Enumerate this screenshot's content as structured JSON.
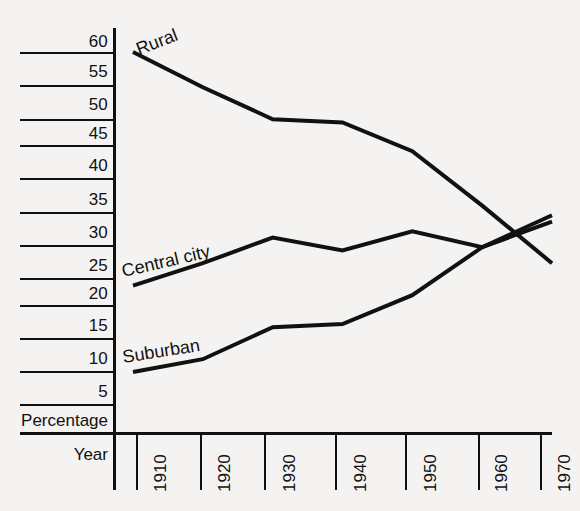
{
  "chart_data": {
    "type": "line",
    "title": "",
    "xlabel": "Year",
    "ylabel": "Percentage",
    "x": [
      1910,
      1920,
      1930,
      1940,
      1950,
      1960,
      1970
    ],
    "xtick_labels": [
      "1910",
      "1920",
      "1930",
      "1940",
      "1950",
      "1960",
      "1970"
    ],
    "ytick_labels": [
      "60",
      "55",
      "50",
      "45",
      "40",
      "35",
      "30",
      "25",
      "20",
      "15",
      "10",
      "5"
    ],
    "ylim": [
      0,
      62
    ],
    "xlim": [
      1907,
      1972
    ],
    "grid": true,
    "legend_position": "inline-labels",
    "series": [
      {
        "name": "Rural",
        "values": [
          60.0,
          54.5,
          49.5,
          49.0,
          44.5,
          36.0,
          27.0
        ],
        "label": "Rural"
      },
      {
        "name": "Central city",
        "values": [
          23.5,
          27.0,
          31.0,
          29.0,
          32.0,
          29.5,
          33.5
        ],
        "label": "Central city"
      },
      {
        "name": "Suburban",
        "values": [
          10.0,
          12.0,
          17.0,
          17.5,
          22.0,
          29.5,
          34.5
        ],
        "label": "Suburban"
      }
    ],
    "colors": {
      "line": "#111111",
      "background": "#f4f3f1",
      "axis": "#111111"
    }
  }
}
